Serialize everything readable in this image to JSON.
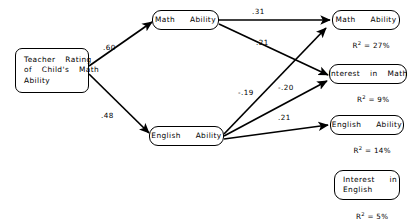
{
  "diagram": {
    "type": "path-diagram",
    "title": "",
    "background_color": "#ffffff",
    "stroke_color": "#000000",
    "nodes": [
      {
        "id": "teacher-rating",
        "label": "Teacher  Rating\nof  Child's  Math\nAbility",
        "r2": "",
        "shape": "rect"
      },
      {
        "id": "math-ability-predictor",
        "label": "Math   Ability",
        "r2": "",
        "shape": "pill"
      },
      {
        "id": "english-ability-predictor",
        "label": "English   Ability",
        "r2": "",
        "shape": "pill"
      },
      {
        "id": "math-ability-outcome",
        "label": "Math   Ability",
        "r2_prefix": "R",
        "r2_exp": "2",
        "r2_value": " = 27%",
        "shape": "pill"
      },
      {
        "id": "interest-in-math-outcome",
        "label": "Interest  in  Math",
        "r2_prefix": "R",
        "r2_exp": "2",
        "r2_value": " = 9%",
        "shape": "pill"
      },
      {
        "id": "english-ability-outcome",
        "label": "English   Ability",
        "r2_prefix": "R",
        "r2_exp": "2",
        "r2_value": " = 14%",
        "shape": "pill"
      },
      {
        "id": "interest-in-english-outcome",
        "label": "Interest   in\nEnglish",
        "r2_prefix": "R",
        "r2_exp": "2",
        "r2_value": " = 5%",
        "shape": "pill"
      }
    ],
    "edges": [
      {
        "id": "tr-to-math",
        "from": "teacher-rating",
        "to": "math-ability-predictor",
        "coefficient": ".60"
      },
      {
        "id": "tr-to-english",
        "from": "teacher-rating",
        "to": "english-ability-predictor",
        "coefficient": ".48"
      },
      {
        "id": "math-to-mathout",
        "from": "math-ability-predictor",
        "to": "math-ability-outcome",
        "coefficient": ".31"
      },
      {
        "id": "math-to-interestmath",
        "from": "math-ability-predictor",
        "to": "interest-in-math-outcome",
        "coefficient": ".21"
      },
      {
        "id": "english-to-mathout",
        "from": "english-ability-predictor",
        "to": "math-ability-outcome",
        "coefficient": "-.19"
      },
      {
        "id": "english-to-interestmath",
        "from": "english-ability-predictor",
        "to": "interest-in-math-outcome",
        "coefficient": "-.20"
      },
      {
        "id": "english-to-englishout",
        "from": "english-ability-predictor",
        "to": "english-ability-outcome",
        "coefficient": ".21"
      }
    ]
  }
}
